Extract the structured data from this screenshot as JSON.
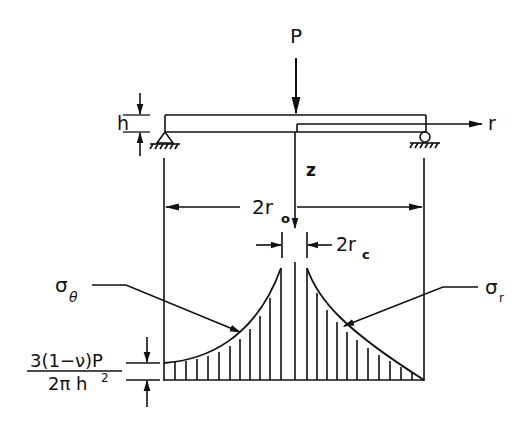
{
  "diagram": {
    "load_label": "P",
    "thickness_label": "h",
    "radial_axis_label": "r",
    "axial_axis_label": "z",
    "outer_diameter_label": "2r",
    "outer_diameter_sub": "o",
    "contact_diameter_label": "2r",
    "contact_diameter_sub": "c",
    "tangential_stress_label": "σ",
    "tangential_stress_sub": "θ",
    "radial_stress_label": "σ",
    "radial_stress_sub": "r",
    "edge_stress_numerator": "3(1−ν)P",
    "edge_stress_denominator_base": "2π h",
    "edge_stress_denominator_exp": "2"
  },
  "colors": {
    "ink": "#111111",
    "background": "#ffffff"
  }
}
